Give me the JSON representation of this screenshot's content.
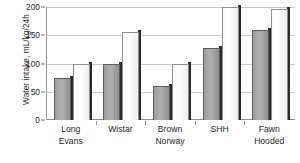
{
  "chart_data": {
    "type": "bar",
    "title": "",
    "xlabel": "",
    "ylabel": "Water intake, mL/kg/24h",
    "ylim": [
      0,
      200
    ],
    "yticks": [
      0,
      50,
      100,
      150,
      200
    ],
    "ytick_labels": [
      "0",
      "50",
      "100",
      "150",
      "200"
    ],
    "grid": true,
    "legend": "none",
    "categories": [
      "Long Evans",
      "Wistar",
      "Brown Norway",
      "SHH",
      "Fawn Hooded"
    ],
    "category_lines": [
      [
        "Long",
        "Evans"
      ],
      [
        "Wistar"
      ],
      [
        "Brown",
        "Norway"
      ],
      [
        "SHH"
      ],
      [
        "Fawn",
        "Hooded"
      ]
    ],
    "series": [
      {
        "name": "series-1",
        "fill": "gray",
        "values": [
          75,
          100,
          60,
          127,
          160
        ]
      },
      {
        "name": "series-2",
        "fill": "white",
        "values": [
          100,
          155,
          100,
          200,
          197
        ]
      }
    ]
  },
  "colors": {
    "bar_gray": "#a5a5a5",
    "bar_white": "#ffffff",
    "bar_outline": "#5d5d5d",
    "gridline": "#c9c9c9",
    "axis": "#8d8d8d",
    "text": "#1f1f1f",
    "background": "#ffffff"
  },
  "axis": {
    "y_title": "Water intake, mL/kg/24h",
    "ticks": [
      {
        "value": 200,
        "label": "200"
      },
      {
        "value": 150,
        "label": "150"
      },
      {
        "value": 100,
        "label": "100"
      },
      {
        "value": 50,
        "label": "50"
      },
      {
        "value": 0,
        "label": "0"
      }
    ]
  }
}
